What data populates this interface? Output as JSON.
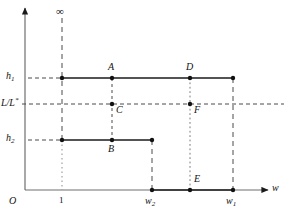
{
  "figure": {
    "type": "diagram",
    "background": "#ffffff",
    "line_color": "#1a1a1a"
  },
  "axes": {
    "x": {
      "label": "w",
      "origin_label": "O",
      "arrow": true,
      "y_px": 190
    },
    "y": {
      "arrow": true,
      "x_px": 25,
      "top_symbol": "∞"
    }
  },
  "y_ticks": [
    {
      "name": "h1",
      "base": "h",
      "sub": "1",
      "y_px": 78
    },
    {
      "name": "LL",
      "base": "L/L",
      "sup": "*",
      "y_px": 104
    },
    {
      "name": "h2",
      "base": "h",
      "sub": "2",
      "y_px": 140
    }
  ],
  "x_ticks": [
    {
      "name": "one",
      "base": "1",
      "sub": "",
      "x_px": 62
    },
    {
      "name": "w2",
      "base": "w",
      "sub": "2",
      "x_px": 152
    },
    {
      "name": "w1",
      "base": "w",
      "sub": "1",
      "x_px": 233
    }
  ],
  "points": [
    {
      "id": "A",
      "label": "A",
      "x_px": 112,
      "y_px": 78,
      "label_dx": -4,
      "label_dy": -14
    },
    {
      "id": "B",
      "label": "B",
      "x_px": 112,
      "y_px": 140,
      "label_dx": -4,
      "label_dy": 6
    },
    {
      "id": "C",
      "label": "C",
      "x_px": 112,
      "y_px": 104,
      "label_dx": 4,
      "label_dy": 2
    },
    {
      "id": "D",
      "label": "D",
      "x_px": 190,
      "y_px": 78,
      "label_dx": -4,
      "label_dy": -14
    },
    {
      "id": "E",
      "label": "E",
      "x_px": 190,
      "y_px": 190,
      "label_dx": 4,
      "label_dy": -14
    },
    {
      "id": "F",
      "label": "F",
      "x_px": 190,
      "y_px": 104,
      "label_dx": 4,
      "label_dy": 2
    }
  ],
  "markers": [
    {
      "name": "h1-left-marker",
      "x_px": 62,
      "y_px": 78
    },
    {
      "name": "h1-right-marker",
      "x_px": 233,
      "y_px": 78
    },
    {
      "name": "h2-left-marker",
      "x_px": 62,
      "y_px": 140
    },
    {
      "name": "h2-right-marker",
      "x_px": 152,
      "y_px": 140
    },
    {
      "name": "zero-left-marker",
      "x_px": 152,
      "y_px": 190
    },
    {
      "name": "zero-right-marker",
      "x_px": 233,
      "y_px": 190
    }
  ],
  "segments": [
    {
      "name": "h1-level-segment",
      "x1": 62,
      "x2": 233,
      "y": 78,
      "style": "solid"
    },
    {
      "name": "h2-level-segment",
      "x1": 62,
      "x2": 152,
      "y": 140,
      "style": "solid"
    },
    {
      "name": "zero-level-segment",
      "x1": 152,
      "x2": 233,
      "y": 190,
      "style": "solid"
    }
  ],
  "guides": [
    {
      "name": "h1-gridline",
      "x1": 28,
      "x2": 62,
      "y": 78,
      "style": "dashed"
    },
    {
      "name": "ll-gridline",
      "x1": 22,
      "x2": 284,
      "y": 104,
      "style": "dashed"
    },
    {
      "name": "h2-gridline",
      "x1": 28,
      "x2": 62,
      "y": 140,
      "style": "dashed"
    },
    {
      "name": "x1-dashed-upper",
      "x": 62,
      "y1": 18,
      "y2": 140,
      "style": "dashed"
    },
    {
      "name": "x1-dotted-lower",
      "x": 62,
      "y1": 140,
      "y2": 190,
      "style": "dotted"
    },
    {
      "name": "w2-dashed-drop",
      "x": 152,
      "y1": 140,
      "y2": 190,
      "style": "dashed"
    },
    {
      "name": "w1-dashed-drop",
      "x": 233,
      "y1": 78,
      "y2": 190,
      "style": "dashed"
    },
    {
      "name": "ac-dotted-link",
      "x": 112,
      "y1": 78,
      "y2": 140,
      "style": "dotted"
    },
    {
      "name": "dfe-dotted-link",
      "x": 190,
      "y1": 78,
      "y2": 190,
      "style": "dotted"
    }
  ]
}
